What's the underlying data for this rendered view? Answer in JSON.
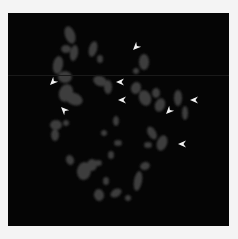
{
  "figure": {
    "type": "fluorescence micrograph (metaphase chromosome spread)",
    "background_color": "#050505",
    "frame_color": "#f4f4f4",
    "chromosome_color": "#3c3c3c",
    "arrowhead_color": "#f2f2f2",
    "panel": {
      "x": 8,
      "y": 13,
      "width": 221,
      "height": 213
    },
    "scanline_y": 62
  },
  "chromosomes": [
    {
      "cx": 62,
      "cy": 22,
      "rx": 5,
      "ry": 9,
      "rot": -20
    },
    {
      "cx": 66,
      "cy": 40,
      "rx": 4,
      "ry": 8,
      "rot": 10
    },
    {
      "cx": 58,
      "cy": 36,
      "rx": 5,
      "ry": 4,
      "rot": 0
    },
    {
      "cx": 85,
      "cy": 36,
      "rx": 4,
      "ry": 8,
      "rot": 15
    },
    {
      "cx": 92,
      "cy": 46,
      "rx": 3,
      "ry": 4,
      "rot": 0
    },
    {
      "cx": 50,
      "cy": 52,
      "rx": 5,
      "ry": 9,
      "rot": 10
    },
    {
      "cx": 57,
      "cy": 64,
      "rx": 7,
      "ry": 6,
      "rot": 0
    },
    {
      "cx": 58,
      "cy": 80,
      "rx": 7,
      "ry": 9,
      "rot": 20
    },
    {
      "cx": 66,
      "cy": 86,
      "rx": 9,
      "ry": 6,
      "rot": 20
    },
    {
      "cx": 92,
      "cy": 68,
      "rx": 7,
      "ry": 5,
      "rot": 20
    },
    {
      "cx": 100,
      "cy": 74,
      "rx": 4,
      "ry": 7,
      "rot": 0
    },
    {
      "cx": 136,
      "cy": 49,
      "rx": 5,
      "ry": 8,
      "rot": 0
    },
    {
      "cx": 128,
      "cy": 58,
      "rx": 3,
      "ry": 3,
      "rot": 0
    },
    {
      "cx": 128,
      "cy": 75,
      "rx": 5,
      "ry": 6,
      "rot": 20
    },
    {
      "cx": 137,
      "cy": 85,
      "rx": 6,
      "ry": 8,
      "rot": -20
    },
    {
      "cx": 148,
      "cy": 80,
      "rx": 4,
      "ry": 5,
      "rot": 0
    },
    {
      "cx": 152,
      "cy": 92,
      "rx": 5,
      "ry": 7,
      "rot": 20
    },
    {
      "cx": 170,
      "cy": 85,
      "rx": 4,
      "ry": 8,
      "rot": 0
    },
    {
      "cx": 177,
      "cy": 100,
      "rx": 3,
      "ry": 7,
      "rot": 0
    },
    {
      "cx": 144,
      "cy": 120,
      "rx": 4,
      "ry": 7,
      "rot": -30
    },
    {
      "cx": 154,
      "cy": 130,
      "rx": 5,
      "ry": 8,
      "rot": 20
    },
    {
      "cx": 140,
      "cy": 132,
      "rx": 4,
      "ry": 3,
      "rot": 0
    },
    {
      "cx": 48,
      "cy": 112,
      "rx": 6,
      "ry": 5,
      "rot": 0
    },
    {
      "cx": 47,
      "cy": 122,
      "rx": 4,
      "ry": 6,
      "rot": 0
    },
    {
      "cx": 58,
      "cy": 110,
      "rx": 3,
      "ry": 3,
      "rot": 0
    },
    {
      "cx": 108,
      "cy": 108,
      "rx": 3,
      "ry": 5,
      "rot": 0
    },
    {
      "cx": 96,
      "cy": 120,
      "rx": 3,
      "ry": 3,
      "rot": 0
    },
    {
      "cx": 110,
      "cy": 130,
      "rx": 4,
      "ry": 3,
      "rot": 0
    },
    {
      "cx": 62,
      "cy": 147,
      "rx": 4,
      "ry": 5,
      "rot": -20
    },
    {
      "cx": 76,
      "cy": 158,
      "rx": 7,
      "ry": 9,
      "rot": 10
    },
    {
      "cx": 84,
      "cy": 152,
      "rx": 5,
      "ry": 6,
      "rot": 0
    },
    {
      "cx": 90,
      "cy": 150,
      "rx": 4,
      "ry": 3,
      "rot": 0
    },
    {
      "cx": 98,
      "cy": 168,
      "rx": 3,
      "ry": 4,
      "rot": 0
    },
    {
      "cx": 103,
      "cy": 142,
      "rx": 3,
      "ry": 4,
      "rot": 0
    },
    {
      "cx": 130,
      "cy": 168,
      "rx": 4,
      "ry": 10,
      "rot": 10
    },
    {
      "cx": 137,
      "cy": 153,
      "rx": 5,
      "ry": 4,
      "rot": -20
    },
    {
      "cx": 91,
      "cy": 182,
      "rx": 5,
      "ry": 6,
      "rot": -10
    },
    {
      "cx": 108,
      "cy": 180,
      "rx": 6,
      "ry": 4,
      "rot": -30
    },
    {
      "cx": 120,
      "cy": 185,
      "rx": 3,
      "ry": 3,
      "rot": 0
    }
  ],
  "arrowheads": [
    {
      "name": "arrowhead-1",
      "x": 125,
      "y": 37,
      "angle": 135
    },
    {
      "name": "arrowhead-2",
      "x": 42,
      "y": 72,
      "angle": 135
    },
    {
      "name": "arrowhead-3",
      "x": 53,
      "y": 94,
      "angle": 225
    },
    {
      "name": "arrowhead-4",
      "x": 108,
      "y": 69,
      "angle": 180
    },
    {
      "name": "arrowhead-5",
      "x": 110,
      "y": 87,
      "angle": 180
    },
    {
      "name": "arrowhead-6",
      "x": 182,
      "y": 87,
      "angle": 180
    },
    {
      "name": "arrowhead-7",
      "x": 158,
      "y": 101,
      "angle": 135
    },
    {
      "name": "arrowhead-8",
      "x": 170,
      "y": 131,
      "angle": 180
    }
  ]
}
